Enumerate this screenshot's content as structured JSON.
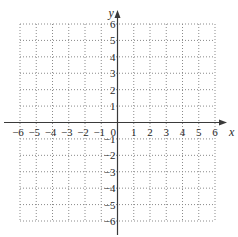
{
  "chart_data": {
    "type": "scatter",
    "title": "",
    "xlabel": "x",
    "ylabel": "y",
    "xlim": [
      -6,
      6
    ],
    "ylim": [
      -6,
      6
    ],
    "grid": true,
    "grid_style": "dotted",
    "x_ticks": [
      -6,
      -5,
      -4,
      -3,
      -2,
      -1,
      1,
      2,
      3,
      4,
      5,
      6
    ],
    "x_tick_labels": [
      "−6",
      "−5",
      "−4",
      "−3",
      "−2",
      "−1",
      "1",
      "2",
      "3",
      "4",
      "5",
      "6"
    ],
    "y_ticks": [
      6,
      5,
      4,
      3,
      2,
      1,
      -1,
      -2,
      -3,
      -4,
      -5,
      -6
    ],
    "y_tick_labels": [
      "6",
      "5",
      "4",
      "3",
      "2",
      "1",
      "−1",
      "−2",
      "−3",
      "−4",
      "−5",
      "−6"
    ],
    "origin_label": "0",
    "series": [],
    "colors": {
      "axis": "#3a3a3a",
      "grid": "#8a8a8a",
      "text": "#2a2a2a"
    }
  }
}
